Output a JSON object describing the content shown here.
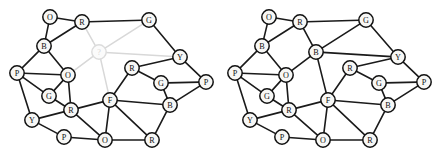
{
  "figure": {
    "caption": "",
    "width": 436,
    "height": 156,
    "background_color": "#ffffff",
    "edge_color": "#1a1a1a",
    "unknown_color": "#d8d8d8",
    "node_fill": "#f7f7f5",
    "node_radius": 7.2
  },
  "chart_data": {
    "type": "diagram",
    "subtype": "node-link-graph-pair",
    "panels": [
      {
        "name": "query-graph",
        "label": "left",
        "offset_x": 0,
        "nodes": [
          {
            "id": "L0",
            "label": "O",
            "x": 50,
            "y": 17,
            "state": "known"
          },
          {
            "id": "L1",
            "label": "R",
            "x": 82,
            "y": 22,
            "state": "known"
          },
          {
            "id": "L2",
            "label": "G",
            "x": 149,
            "y": 20,
            "state": "known"
          },
          {
            "id": "L3",
            "label": "B",
            "x": 44,
            "y": 46,
            "state": "known"
          },
          {
            "id": "L4",
            "label": "?",
            "x": 99,
            "y": 52,
            "state": "unknown"
          },
          {
            "id": "L5",
            "label": "Y",
            "x": 180,
            "y": 57,
            "state": "known"
          },
          {
            "id": "L6",
            "label": "P",
            "x": 17,
            "y": 73,
            "state": "known"
          },
          {
            "id": "L7",
            "label": "O",
            "x": 68,
            "y": 75,
            "state": "known"
          },
          {
            "id": "L8",
            "label": "R",
            "x": 132,
            "y": 68,
            "state": "known"
          },
          {
            "id": "L9",
            "label": "G",
            "x": 161,
            "y": 83,
            "state": "known"
          },
          {
            "id": "L10",
            "label": "P",
            "x": 206,
            "y": 82,
            "state": "known"
          },
          {
            "id": "L11",
            "label": "G",
            "x": 49,
            "y": 96,
            "state": "known"
          },
          {
            "id": "L12",
            "label": "F",
            "x": 110,
            "y": 100,
            "state": "known"
          },
          {
            "id": "L13",
            "label": "B",
            "x": 170,
            "y": 105,
            "state": "known"
          },
          {
            "id": "L14",
            "label": "R",
            "x": 71,
            "y": 110,
            "state": "known"
          },
          {
            "id": "L15",
            "label": "Y",
            "x": 32,
            "y": 120,
            "state": "known"
          },
          {
            "id": "L16",
            "label": "P",
            "x": 64,
            "y": 137,
            "state": "known"
          },
          {
            "id": "L17",
            "label": "O",
            "x": 105,
            "y": 140,
            "state": "known"
          },
          {
            "id": "L18",
            "label": "R",
            "x": 152,
            "y": 140,
            "state": "known"
          }
        ],
        "edges": [
          {
            "a": "L0",
            "b": "L1",
            "state": "known"
          },
          {
            "a": "L0",
            "b": "L3",
            "state": "known"
          },
          {
            "a": "L1",
            "b": "L2",
            "state": "known"
          },
          {
            "a": "L1",
            "b": "L3",
            "state": "known"
          },
          {
            "a": "L1",
            "b": "L4",
            "state": "unknown"
          },
          {
            "a": "L2",
            "b": "L4",
            "state": "unknown"
          },
          {
            "a": "L2",
            "b": "L5",
            "state": "known"
          },
          {
            "a": "L3",
            "b": "L6",
            "state": "known"
          },
          {
            "a": "L3",
            "b": "L7",
            "state": "known"
          },
          {
            "a": "L4",
            "b": "L5",
            "state": "unknown"
          },
          {
            "a": "L4",
            "b": "L7",
            "state": "unknown"
          },
          {
            "a": "L4",
            "b": "L12",
            "state": "unknown"
          },
          {
            "a": "L5",
            "b": "L8",
            "state": "known"
          },
          {
            "a": "L5",
            "b": "L10",
            "state": "known"
          },
          {
            "a": "L6",
            "b": "L7",
            "state": "known"
          },
          {
            "a": "L6",
            "b": "L11",
            "state": "known"
          },
          {
            "a": "L6",
            "b": "L15",
            "state": "known"
          },
          {
            "a": "L7",
            "b": "L11",
            "state": "known"
          },
          {
            "a": "L7",
            "b": "L14",
            "state": "known"
          },
          {
            "a": "L8",
            "b": "L9",
            "state": "known"
          },
          {
            "a": "L8",
            "b": "L12",
            "state": "known"
          },
          {
            "a": "L9",
            "b": "L10",
            "state": "known"
          },
          {
            "a": "L9",
            "b": "L13",
            "state": "known"
          },
          {
            "a": "L10",
            "b": "L13",
            "state": "known"
          },
          {
            "a": "L11",
            "b": "L14",
            "state": "known"
          },
          {
            "a": "L12",
            "b": "L13",
            "state": "known"
          },
          {
            "a": "L12",
            "b": "L14",
            "state": "known"
          },
          {
            "a": "L12",
            "b": "L17",
            "state": "known"
          },
          {
            "a": "L12",
            "b": "L18",
            "state": "known"
          },
          {
            "a": "L13",
            "b": "L18",
            "state": "known"
          },
          {
            "a": "L14",
            "b": "L15",
            "state": "known"
          },
          {
            "a": "L14",
            "b": "L17",
            "state": "known"
          },
          {
            "a": "L15",
            "b": "L16",
            "state": "known"
          },
          {
            "a": "L16",
            "b": "L17",
            "state": "known"
          },
          {
            "a": "L17",
            "b": "L18",
            "state": "known"
          }
        ]
      },
      {
        "name": "solved-graph",
        "label": "right",
        "offset_x": 218,
        "nodes": [
          {
            "id": "R0",
            "label": "O",
            "x": 269,
            "y": 17,
            "state": "known"
          },
          {
            "id": "R1",
            "label": "R",
            "x": 300,
            "y": 22,
            "state": "known"
          },
          {
            "id": "R2",
            "label": "G",
            "x": 366,
            "y": 20,
            "state": "known"
          },
          {
            "id": "R3",
            "label": "B",
            "x": 262,
            "y": 46,
            "state": "known"
          },
          {
            "id": "R4",
            "label": "B",
            "x": 316,
            "y": 52,
            "state": "solved"
          },
          {
            "id": "R5",
            "label": "Y",
            "x": 398,
            "y": 57,
            "state": "known"
          },
          {
            "id": "R6",
            "label": "P",
            "x": 235,
            "y": 73,
            "state": "known"
          },
          {
            "id": "R7",
            "label": "O",
            "x": 286,
            "y": 75,
            "state": "known"
          },
          {
            "id": "R8",
            "label": "R",
            "x": 350,
            "y": 68,
            "state": "known"
          },
          {
            "id": "R9",
            "label": "G",
            "x": 379,
            "y": 83,
            "state": "known"
          },
          {
            "id": "R10",
            "label": "P",
            "x": 424,
            "y": 82,
            "state": "known"
          },
          {
            "id": "R11",
            "label": "G",
            "x": 267,
            "y": 96,
            "state": "known"
          },
          {
            "id": "R12",
            "label": "F",
            "x": 328,
            "y": 100,
            "state": "known"
          },
          {
            "id": "R13",
            "label": "B",
            "x": 388,
            "y": 105,
            "state": "known"
          },
          {
            "id": "R14",
            "label": "R",
            "x": 289,
            "y": 110,
            "state": "known"
          },
          {
            "id": "R15",
            "label": "Y",
            "x": 250,
            "y": 120,
            "state": "known"
          },
          {
            "id": "R16",
            "label": "P",
            "x": 282,
            "y": 137,
            "state": "known"
          },
          {
            "id": "R17",
            "label": "O",
            "x": 323,
            "y": 140,
            "state": "known"
          },
          {
            "id": "R18",
            "label": "R",
            "x": 370,
            "y": 140,
            "state": "known"
          }
        ],
        "edges": [
          {
            "a": "R0",
            "b": "R1",
            "state": "known"
          },
          {
            "a": "R0",
            "b": "R3",
            "state": "known"
          },
          {
            "a": "R1",
            "b": "R2",
            "state": "known"
          },
          {
            "a": "R1",
            "b": "R3",
            "state": "known"
          },
          {
            "a": "R1",
            "b": "R4",
            "state": "known"
          },
          {
            "a": "R2",
            "b": "R4",
            "state": "known"
          },
          {
            "a": "R2",
            "b": "R5",
            "state": "known"
          },
          {
            "a": "R3",
            "b": "R6",
            "state": "known"
          },
          {
            "a": "R3",
            "b": "R7",
            "state": "known"
          },
          {
            "a": "R4",
            "b": "R5",
            "state": "known"
          },
          {
            "a": "R4",
            "b": "R7",
            "state": "known"
          },
          {
            "a": "R4",
            "b": "R12",
            "state": "known"
          },
          {
            "a": "R5",
            "b": "R8",
            "state": "known"
          },
          {
            "a": "R5",
            "b": "R10",
            "state": "known"
          },
          {
            "a": "R6",
            "b": "R7",
            "state": "known"
          },
          {
            "a": "R6",
            "b": "R11",
            "state": "known"
          },
          {
            "a": "R6",
            "b": "R15",
            "state": "known"
          },
          {
            "a": "R7",
            "b": "R11",
            "state": "known"
          },
          {
            "a": "R7",
            "b": "R14",
            "state": "known"
          },
          {
            "a": "R8",
            "b": "R9",
            "state": "known"
          },
          {
            "a": "R8",
            "b": "R12",
            "state": "known"
          },
          {
            "a": "R9",
            "b": "R10",
            "state": "known"
          },
          {
            "a": "R9",
            "b": "R13",
            "state": "known"
          },
          {
            "a": "R10",
            "b": "R13",
            "state": "known"
          },
          {
            "a": "R11",
            "b": "R14",
            "state": "known"
          },
          {
            "a": "R12",
            "b": "R13",
            "state": "known"
          },
          {
            "a": "R12",
            "b": "R14",
            "state": "known"
          },
          {
            "a": "R12",
            "b": "R17",
            "state": "known"
          },
          {
            "a": "R12",
            "b": "R18",
            "state": "known"
          },
          {
            "a": "R13",
            "b": "R18",
            "state": "known"
          },
          {
            "a": "R14",
            "b": "R15",
            "state": "known"
          },
          {
            "a": "R14",
            "b": "R17",
            "state": "known"
          },
          {
            "a": "R15",
            "b": "R16",
            "state": "known"
          },
          {
            "a": "R16",
            "b": "R17",
            "state": "known"
          },
          {
            "a": "R17",
            "b": "R18",
            "state": "known"
          }
        ]
      }
    ]
  }
}
